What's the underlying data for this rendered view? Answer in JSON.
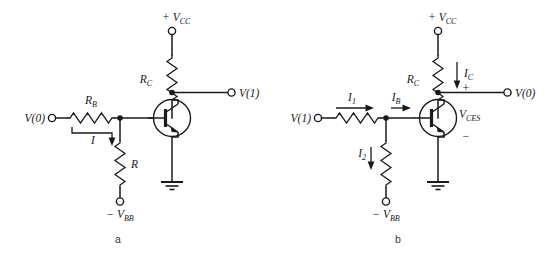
{
  "figure": {
    "background_color": "#ffffff",
    "ink_color": "#1a1a1a",
    "panels": [
      {
        "id": "a",
        "caption": "a",
        "supply_label": "+ V",
        "supply_sub": "CC",
        "collector_resistor": "R",
        "collector_resistor_sub": "C",
        "base_resistor": "R",
        "base_resistor_sub": "B",
        "pulldown_resistor": "R",
        "pulldown_resistor_sub": "",
        "input_label": "V(0)",
        "output_label": "V(1)",
        "bias_label": "− V",
        "bias_sub": "BB",
        "current_label": "I",
        "current_sub": "",
        "device": "npn-transistor"
      },
      {
        "id": "b",
        "caption": "b",
        "supply_label": "+ V",
        "supply_sub": "CC",
        "collector_resistor": "R",
        "collector_resistor_sub": "C",
        "base_resistor": "",
        "base_resistor_sub": "",
        "pulldown_resistor": "",
        "pulldown_resistor_sub": "",
        "input_label": "V(1)",
        "output_label": "V(0)",
        "bias_label": "− V",
        "bias_sub": "BB",
        "collector_current": "I",
        "collector_current_sub": "C",
        "input_current": "I",
        "input_current_sub": "1",
        "base_current": "I",
        "base_current_sub": "B",
        "pulldown_current": "I",
        "pulldown_current_sub": "2",
        "saturation_voltage": "V",
        "saturation_voltage_sub": "CES",
        "plus_sign": "+",
        "minus_sign": "−",
        "device": "npn-transistor"
      }
    ]
  }
}
